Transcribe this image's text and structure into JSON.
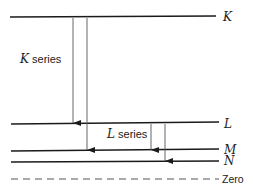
{
  "diagram": {
    "levels": [
      {
        "id": "K",
        "label": "K",
        "y": 17
      },
      {
        "id": "L",
        "label": "L",
        "y": 124
      },
      {
        "id": "M",
        "label": "M",
        "y": 151
      },
      {
        "id": "N",
        "label": "N",
        "y": 162
      },
      {
        "id": "zero",
        "label": "Zero",
        "y": 179,
        "dashed": true
      }
    ],
    "series": [
      {
        "letter": "K",
        "suffix": " series"
      },
      {
        "letter": "L",
        "suffix": " series"
      }
    ],
    "transitions": [
      {
        "from": "K",
        "to": "L",
        "x": 73
      },
      {
        "from": "K",
        "to": "M",
        "x": 87
      },
      {
        "from": "L",
        "to": "M",
        "x": 151
      },
      {
        "from": "L",
        "to": "N",
        "x": 165
      }
    ],
    "colors": {
      "line": "#1a1a1a",
      "arrow": "#555555"
    }
  }
}
